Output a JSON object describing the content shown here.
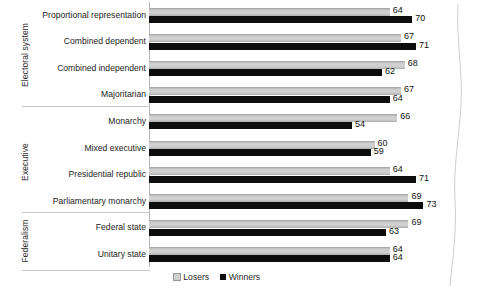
{
  "chart_data": {
    "type": "bar",
    "orientation": "horizontal",
    "title": "",
    "subtitle": "",
    "xlabel": "",
    "ylabel": "",
    "xlim": [
      0,
      75
    ],
    "grid": false,
    "legend_position": "bottom-center",
    "legend": [
      "Losers",
      "Winners"
    ],
    "categories": [
      "Proportional representation",
      "Combined dependent",
      "Combined independent",
      "Majoritarian",
      "Monarchy",
      "Mixed executive",
      "Presidential republic",
      "Parliamentary monarchy",
      "Federal state",
      "Unitary state"
    ],
    "series": [
      {
        "name": "Losers",
        "color": "#cfcfcf",
        "values": [
          64,
          67,
          68,
          67,
          66,
          60,
          64,
          69,
          69,
          64
        ]
      },
      {
        "name": "Winners",
        "color": "#0d0d0d",
        "values": [
          70,
          71,
          62,
          64,
          54,
          59,
          71,
          73,
          63,
          64
        ]
      }
    ],
    "groups": [
      {
        "label": "Electoral system",
        "start": 0,
        "count": 4
      },
      {
        "label": "Executive",
        "start": 4,
        "count": 4
      },
      {
        "label": "Federalism",
        "start": 8,
        "count": 2
      }
    ]
  },
  "legend": {
    "losers_label": "Losers",
    "winners_label": "Winners"
  }
}
